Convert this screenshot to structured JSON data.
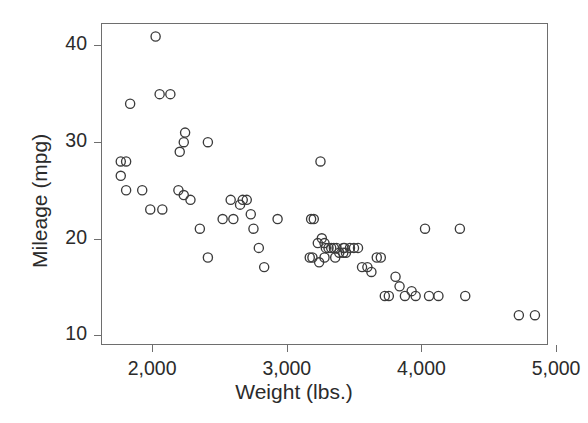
{
  "chart_data": {
    "type": "scatter",
    "title": "",
    "xlabel": "Weight (lbs.)",
    "ylabel": "Mileage (mpg)",
    "xlim": [
      1620,
      4940
    ],
    "ylim": [
      9.0,
      42.3
    ],
    "xticks": [
      2000,
      3000,
      4000,
      5000
    ],
    "xticklabels": [
      "2,000",
      "3,000",
      "4,000",
      "5,000"
    ],
    "yticks": [
      10,
      20,
      30,
      40
    ],
    "yticklabels": [
      "10",
      "20",
      "30",
      "40"
    ],
    "grid": false,
    "legend": false,
    "marker": "open-circle",
    "marker_color": "#3b3b3b",
    "axis_color": "#6e6e6e",
    "background": "#ffffff",
    "n_points": 74,
    "x": [
      2020,
      1800,
      1760,
      2050,
      2130,
      1830,
      2230,
      2200,
      2240,
      2410,
      1760,
      1800,
      1920,
      1980,
      2070,
      2190,
      2230,
      2280,
      2350,
      2410,
      2520,
      2580,
      2600,
      2650,
      2670,
      2700,
      2730,
      2750,
      2790,
      2830,
      2930,
      3250,
      3180,
      3200,
      3230,
      3260,
      3280,
      3290,
      3310,
      3330,
      3350,
      3370,
      3390,
      3420,
      3430,
      3170,
      3190,
      3240,
      3280,
      3360,
      3420,
      3440,
      3470,
      3500,
      3530,
      3560,
      3600,
      3630,
      3670,
      3700,
      3730,
      3760,
      3810,
      3840,
      3880,
      3930,
      3960,
      4030,
      4060,
      4130,
      4290,
      4330,
      4730,
      4850
    ],
    "y": [
      41.0,
      28.0,
      28.0,
      35.0,
      35.0,
      34.0,
      30.0,
      29.0,
      31.0,
      30.0,
      26.5,
      25.0,
      25.0,
      23.0,
      23.0,
      25.0,
      24.5,
      24.0,
      21.0,
      18.0,
      22.0,
      24.0,
      22.0,
      23.5,
      24.0,
      24.0,
      22.5,
      21.0,
      19.0,
      17.0,
      22.0,
      28.0,
      22.0,
      22.0,
      19.5,
      20.0,
      19.5,
      19.0,
      19.0,
      19.0,
      19.0,
      19.0,
      18.5,
      19.0,
      19.0,
      18.0,
      18.0,
      17.5,
      18.0,
      18.0,
      18.5,
      18.5,
      19.0,
      19.0,
      19.0,
      17.0,
      17.0,
      16.5,
      18.0,
      18.0,
      14.0,
      14.0,
      16.0,
      15.0,
      14.0,
      14.5,
      14.0,
      21.0,
      14.0,
      14.0,
      21.0,
      14.0,
      12.0,
      12.0
    ]
  }
}
